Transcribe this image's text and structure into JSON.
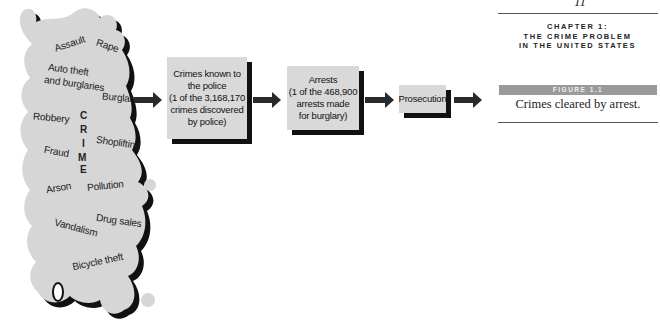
{
  "page": {
    "number": "11",
    "chapter_lines": [
      "CHAPTER 1:",
      "THE CRIME PROBLEM",
      "IN THE UNITED STATES"
    ],
    "figure_label": "FIGURE 1.1",
    "caption": "Crimes cleared by arrest."
  },
  "crime_blob": {
    "title_letters": [
      "C",
      "R",
      "I",
      "M",
      "E"
    ],
    "words": [
      "Assault",
      "Rape",
      "Auto theft",
      "and burglaries",
      "Burglary",
      "Robbery",
      "Fraud",
      "Shoplifting",
      "Arson",
      "Pollution",
      "Drug sales",
      "Vandalism",
      "Bicycle theft"
    ]
  },
  "flow": {
    "boxes": [
      {
        "lines": [
          "Crimes known to",
          "the police",
          "(1 of the 3,168,170",
          "crimes discovered",
          "by police)"
        ]
      },
      {
        "lines": [
          "Arrests",
          "(1 of the 468,900",
          "arrests made",
          "for burglary)"
        ]
      },
      {
        "lines": [
          "Prosecution"
        ]
      }
    ]
  },
  "colors": {
    "box_fill": "#d9d9d9",
    "shadow": "#111111",
    "arrow": "#2a2a2a",
    "figure_bar": "#9a9a9a"
  }
}
